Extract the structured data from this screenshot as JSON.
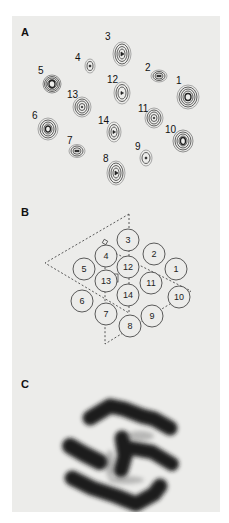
{
  "figure": {
    "panels": [
      {
        "label": "A",
        "description": "Contour map of 14 density peaks"
      },
      {
        "label": "B",
        "description": "Schematic of 14 subunits arranged in two triangles"
      },
      {
        "label": "C",
        "description": "Projection density image"
      }
    ]
  },
  "panel_a": {
    "label": "A",
    "peaks": [
      {
        "id": "1",
        "x": 188,
        "y": 97
      },
      {
        "id": "2",
        "x": 159,
        "y": 76
      },
      {
        "id": "3",
        "x": 122,
        "y": 55
      },
      {
        "id": "4",
        "x": 90,
        "y": 67
      },
      {
        "id": "5",
        "x": 52,
        "y": 85
      },
      {
        "id": "6",
        "x": 48,
        "y": 129
      },
      {
        "id": "7",
        "x": 77,
        "y": 151
      },
      {
        "id": "8",
        "x": 116,
        "y": 173
      },
      {
        "id": "9",
        "x": 146,
        "y": 158
      },
      {
        "id": "10",
        "x": 183,
        "y": 141
      },
      {
        "id": "11",
        "x": 154,
        "y": 118
      },
      {
        "id": "12",
        "x": 122,
        "y": 93
      },
      {
        "id": "13",
        "x": 82,
        "y": 107
      },
      {
        "id": "14",
        "x": 114,
        "y": 132
      }
    ]
  },
  "panel_b": {
    "label": "B",
    "subunits": [
      {
        "id": "1",
        "x": 164,
        "y": 73
      },
      {
        "id": "2",
        "x": 142,
        "y": 58
      },
      {
        "id": "3",
        "x": 116,
        "y": 44
      },
      {
        "id": "4",
        "x": 94,
        "y": 60
      },
      {
        "id": "5",
        "x": 72,
        "y": 73
      },
      {
        "id": "6",
        "x": 70,
        "y": 105
      },
      {
        "id": "7",
        "x": 94,
        "y": 118
      },
      {
        "id": "8",
        "x": 118,
        "y": 130
      },
      {
        "id": "9",
        "x": 140,
        "y": 120
      },
      {
        "id": "10",
        "x": 167,
        "y": 101
      },
      {
        "id": "11",
        "x": 139,
        "y": 87
      },
      {
        "id": "12",
        "x": 116,
        "y": 71
      },
      {
        "id": "13",
        "x": 94,
        "y": 85
      },
      {
        "id": "14",
        "x": 116,
        "y": 99
      }
    ]
  },
  "panel_c": {
    "label": "C"
  }
}
